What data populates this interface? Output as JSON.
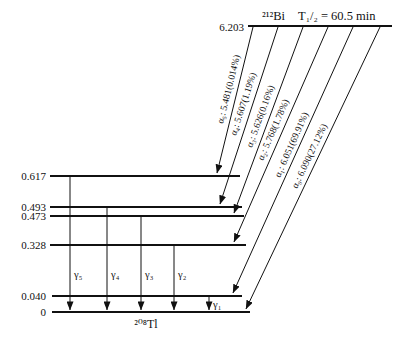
{
  "parent": {
    "isotope": "²¹²Bi",
    "half_life": "T₁/₂ = 60.5 min",
    "energy": "6.203"
  },
  "daughter": {
    "isotope": "²⁰⁸Tl"
  },
  "levels": [
    {
      "energy": "0.617"
    },
    {
      "energy": "0.493"
    },
    {
      "energy": "0.473"
    },
    {
      "energy": "0.328"
    },
    {
      "energy": "0.040"
    },
    {
      "energy": "0"
    }
  ],
  "alphas": [
    {
      "label": "α₅: 5.481(0.014%)",
      "energy_mev": "5.481",
      "intensity": "0.014%",
      "to_level_mev": "0.617"
    },
    {
      "label": "α₄: 5.607(1.19%)",
      "energy_mev": "5.607",
      "intensity": "1.19%",
      "to_level_mev": "0.493"
    },
    {
      "label": "α₃: 5.626(0.16%)",
      "energy_mev": "5.626",
      "intensity": "0.16%",
      "to_level_mev": "0.473"
    },
    {
      "label": "α₂: 5.768(1.78%)",
      "energy_mev": "5.768",
      "intensity": "1.78%",
      "to_level_mev": "0.328"
    },
    {
      "label": "α₁: 6.051(69.91%)",
      "energy_mev": "6.051",
      "intensity": "69.91%",
      "to_level_mev": "0.040"
    },
    {
      "label": "α₀: 6.090(27.12%)",
      "energy_mev": "6.090",
      "intensity": "27.12%",
      "to_level_mev": "0"
    }
  ],
  "gammas": [
    {
      "label": "γ₅",
      "from_level_mev": "0.617",
      "to_level_mev": "0"
    },
    {
      "label": "γ₄",
      "from_level_mev": "0.493",
      "to_level_mev": "0"
    },
    {
      "label": "γ₃",
      "from_level_mev": "0.473",
      "to_level_mev": "0"
    },
    {
      "label": "γ₂",
      "from_level_mev": "0.328",
      "to_level_mev": "0"
    },
    {
      "label": "γ₁",
      "from_level_mev": "0.040",
      "to_level_mev": "0"
    }
  ]
}
